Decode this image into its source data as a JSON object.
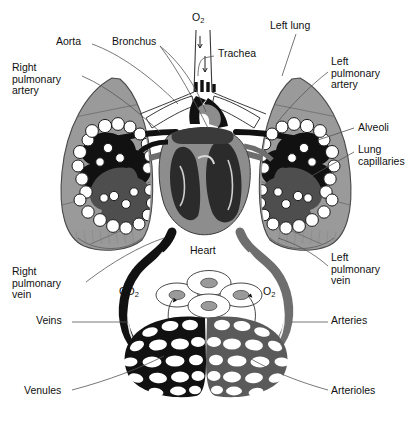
{
  "diagram": {
    "colors": {
      "lung_fill": "#9a9a9a",
      "lung_stroke": "#4a4a4a",
      "deoxygenated": "#111111",
      "oxygenated": "#6e6e6e",
      "alveoli_fill": "#ffffff",
      "alveoli_stroke": "#222222",
      "leader_line": "#555555",
      "text": "#111111",
      "background": "#ffffff",
      "cell_fill": "#ffffff",
      "nucleus_fill": "#9a9a9a"
    },
    "labels": [
      {
        "id": "aorta",
        "text": "Aorta",
        "x": 56,
        "y": 42,
        "align": "left"
      },
      {
        "id": "bronchus",
        "text": "Bronchus",
        "x": 112,
        "y": 42,
        "align": "left"
      },
      {
        "id": "o2-top",
        "text": "O",
        "sub": "2",
        "x": 192,
        "y": 16,
        "align": "left"
      },
      {
        "id": "trachea",
        "text": "Trachea",
        "x": 216,
        "y": 53,
        "align": "left"
      },
      {
        "id": "left-lung",
        "text": "Left lung",
        "x": 270,
        "y": 23,
        "align": "left"
      },
      {
        "id": "right-pulmonary-artery",
        "text": "Right\npulmonary\nartery",
        "x": 12,
        "y": 66,
        "align": "left"
      },
      {
        "id": "left-pulmonary-artery",
        "text": "Left\npulmonary\nartery",
        "x": 330,
        "y": 60,
        "align": "left"
      },
      {
        "id": "alveoli",
        "text": "Alveoli",
        "x": 357,
        "y": 124,
        "align": "left"
      },
      {
        "id": "lung-capillaries",
        "text": "Lung\ncapillaries",
        "x": 357,
        "y": 147,
        "align": "left"
      },
      {
        "id": "heart",
        "text": "Heart",
        "x": 190,
        "y": 250,
        "align": "left"
      },
      {
        "id": "right-pulmonary-vein",
        "text": "Right\npulmonary\nvein",
        "x": 12,
        "y": 270,
        "align": "left"
      },
      {
        "id": "left-pulmonary-vein",
        "text": "Left\npulmonary\nvein",
        "x": 330,
        "y": 255,
        "align": "left"
      },
      {
        "id": "co2",
        "text": "CO",
        "sub": "2",
        "x": 120,
        "y": 290,
        "align": "left"
      },
      {
        "id": "o2-tissue",
        "text": "O",
        "sub": "2",
        "x": 262,
        "y": 290,
        "align": "left"
      },
      {
        "id": "veins",
        "text": "Veins",
        "x": 36,
        "y": 319,
        "align": "left"
      },
      {
        "id": "arteries",
        "text": "Arteries",
        "x": 330,
        "y": 319,
        "align": "left"
      },
      {
        "id": "venules",
        "text": "Venules",
        "x": 24,
        "y": 389,
        "align": "left"
      },
      {
        "id": "arterioles",
        "text": "Arterioles",
        "x": 330,
        "y": 389,
        "align": "left"
      }
    ],
    "structures": [
      {
        "name": "right-lung",
        "type": "organ",
        "fill": "#9a9a9a"
      },
      {
        "name": "left-lung",
        "type": "organ",
        "fill": "#9a9a9a"
      },
      {
        "name": "heart-cross-section",
        "type": "organ"
      },
      {
        "name": "trachea",
        "type": "airway"
      },
      {
        "name": "bronchus-right",
        "type": "airway"
      },
      {
        "name": "bronchus-left",
        "type": "airway"
      },
      {
        "name": "alveolar-cluster-right",
        "type": "alveoli"
      },
      {
        "name": "alveolar-cluster-left",
        "type": "alveoli"
      },
      {
        "name": "systemic-capillary-bed-venous",
        "type": "capillary",
        "fill": "#111111"
      },
      {
        "name": "systemic-capillary-bed-arterial",
        "type": "capillary",
        "fill": "#6e6e6e"
      },
      {
        "name": "body-tissue-cells",
        "type": "cells"
      },
      {
        "name": "vena-cava-loop",
        "type": "vessel",
        "fill": "#111111"
      },
      {
        "name": "aorta-loop",
        "type": "vessel",
        "fill": "#6e6e6e"
      }
    ]
  }
}
